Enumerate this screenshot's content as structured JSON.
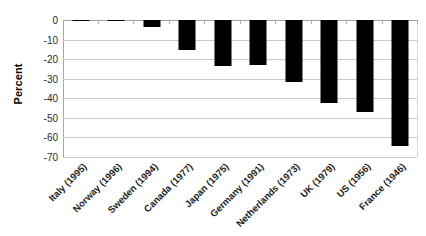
{
  "chart_data": {
    "type": "bar",
    "title": "",
    "subtitle": "",
    "xlabel": "",
    "ylabel": "Percent",
    "ylim": [
      -70,
      0
    ],
    "ytick_labels": [
      "0",
      "-10",
      "-20",
      "-30",
      "-40",
      "-50",
      "-60",
      "-70"
    ],
    "ytick_values": [
      0,
      -10,
      -20,
      -30,
      -40,
      -50,
      -60,
      -70
    ],
    "grid": true,
    "legend": false,
    "orientation": "vertical",
    "bar_color": "#000000",
    "categories": [
      "Italy (1995)",
      "Norway (1996)",
      "Sweden (1994)",
      "Canada (1977)",
      "Japan (1975)",
      "Germany (1991)",
      "Netherlands (1973)",
      "UK (1979)",
      "US (1956)",
      "France (1946)"
    ],
    "values": [
      -0.4,
      -0.4,
      -3.5,
      -15.5,
      -23.5,
      -23,
      -31.5,
      -42.5,
      -47,
      -64.5
    ],
    "series": [
      {
        "name": "Percent change",
        "values": [
          -0.4,
          -0.4,
          -3.5,
          -15.5,
          -23.5,
          -23,
          -31.5,
          -42.5,
          -47,
          -64.5
        ]
      }
    ]
  }
}
